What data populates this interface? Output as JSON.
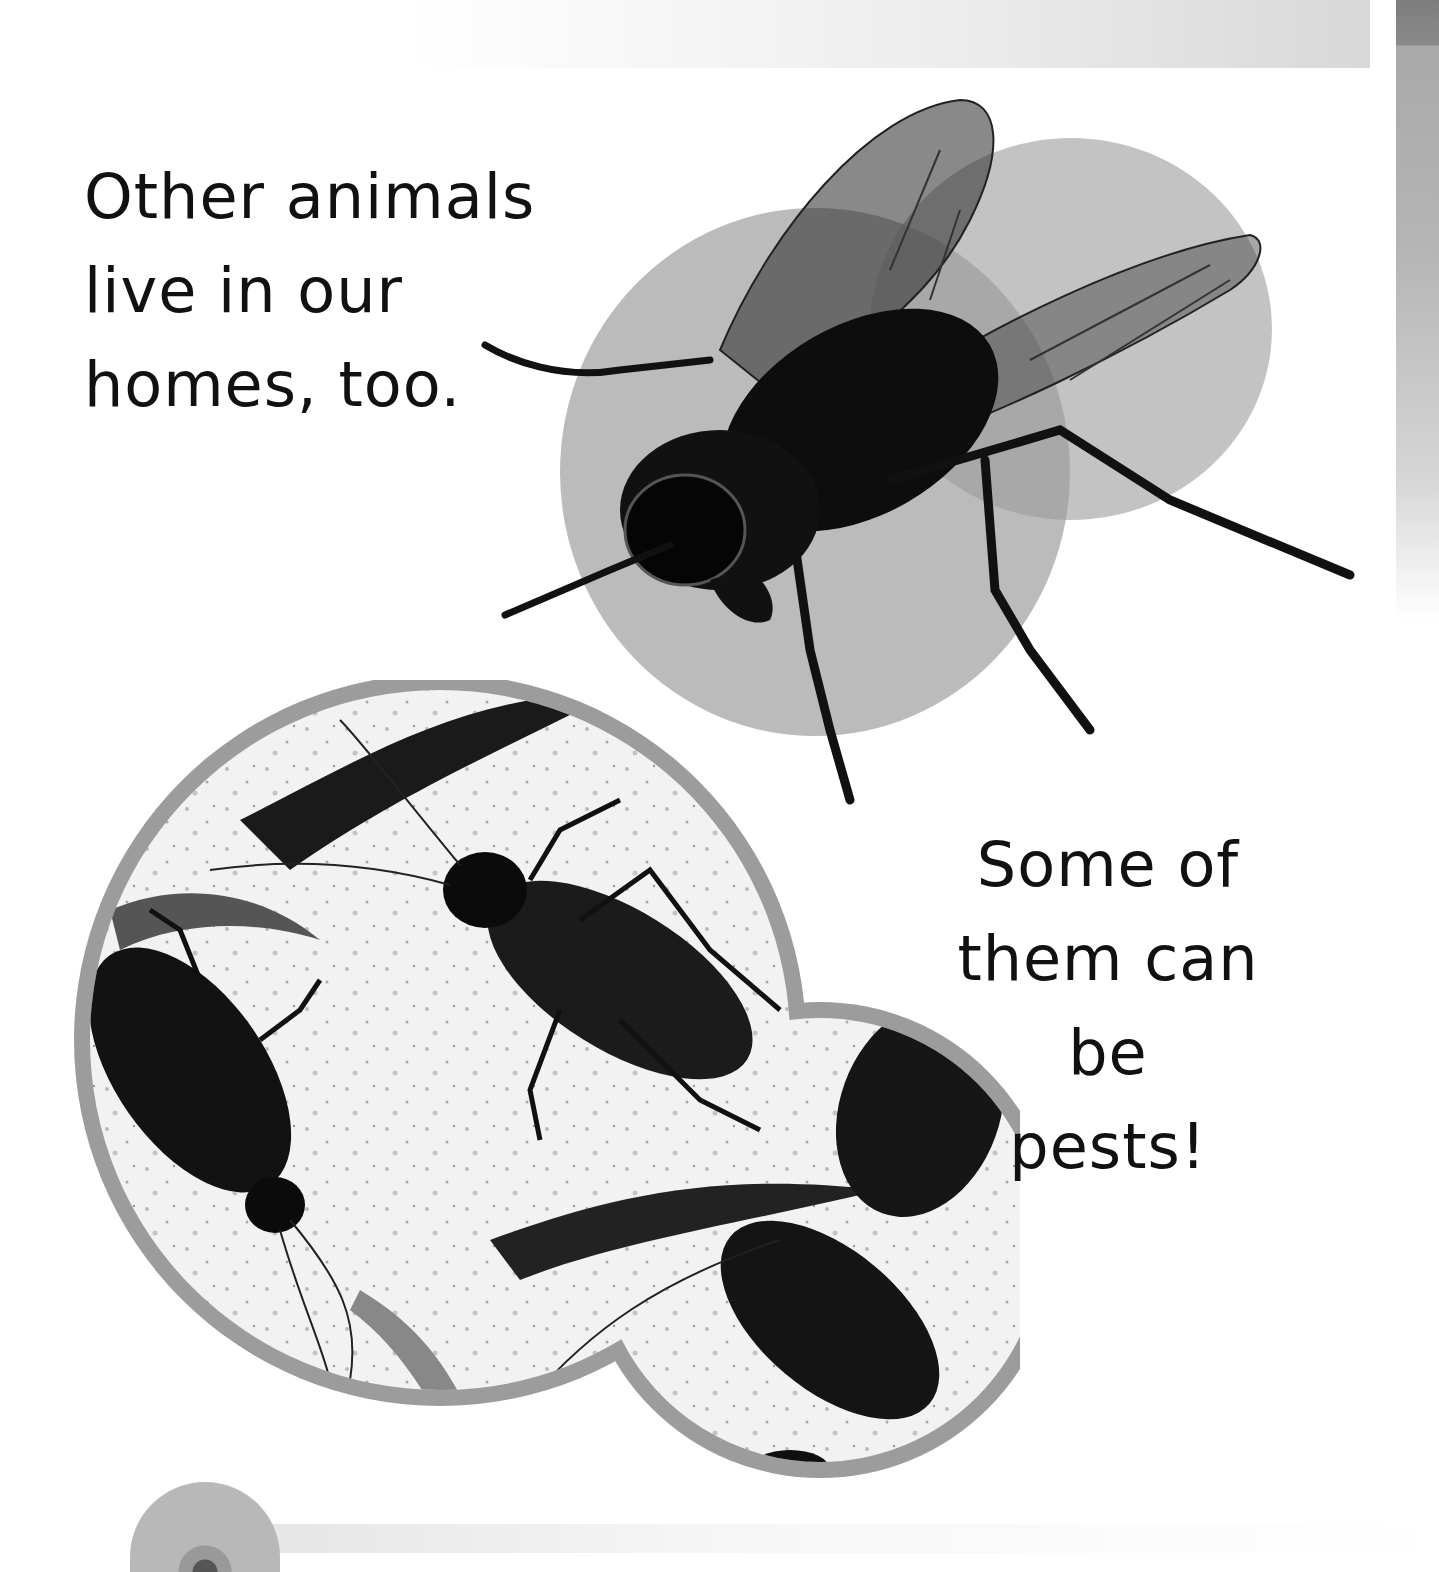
{
  "page": {
    "text_top": {
      "lines": [
        "Other animals",
        "live in our",
        "homes, too."
      ]
    },
    "text_bottom": {
      "lines": [
        "Some of",
        "them can be",
        "pests!"
      ]
    },
    "images": {
      "fly": "housefly-photo",
      "cockroaches": "cockroaches-photo",
      "eye": "eye-thumbnail"
    },
    "colors": {
      "text": "#111111",
      "circle_grey": "#a3a3a3",
      "frame_grey": "#9c9c9c",
      "edge_strip": "#8a8a8a"
    }
  }
}
